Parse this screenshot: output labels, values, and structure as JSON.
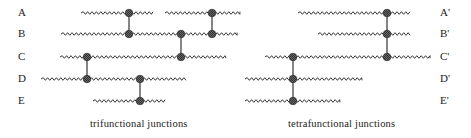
{
  "chart_data": {
    "type": "diagram",
    "panels": [
      {
        "caption": "trifunctional junctions",
        "row_labels": [
          "A",
          "B",
          "C",
          "D",
          "E"
        ],
        "rows_y": [
          13,
          34,
          57,
          79,
          101
        ],
        "label_x": 20,
        "chains": [
          {
            "row": 0,
            "x1": 81,
            "x2": 153
          },
          {
            "row": 0,
            "x1": 165,
            "x2": 240
          },
          {
            "row": 1,
            "x1": 61,
            "x2": 237
          },
          {
            "row": 2,
            "x1": 60,
            "x2": 226
          },
          {
            "row": 3,
            "x1": 41,
            "x2": 186
          },
          {
            "row": 4,
            "x1": 93,
            "x2": 165
          }
        ],
        "junctions": [
          {
            "x": 129,
            "from_row": 0,
            "to_row": 1
          },
          {
            "x": 212,
            "from_row": 0,
            "to_row": 1
          },
          {
            "x": 181,
            "from_row": 1,
            "to_row": 2
          },
          {
            "x": 87,
            "from_row": 2,
            "to_row": 3
          },
          {
            "x": 140,
            "from_row": 3,
            "to_row": 4
          }
        ],
        "caption_x": 90,
        "caption_y": 127
      },
      {
        "caption": "tetrafunctional junctions",
        "row_labels": [
          "A'",
          "B'",
          "C'",
          "D'",
          "E'"
        ],
        "rows_y": [
          13,
          34,
          57,
          79,
          101
        ],
        "label_x": 440,
        "chains": [
          {
            "row": 0,
            "x1": 298,
            "x2": 410
          },
          {
            "row": 1,
            "x1": 318,
            "x2": 410
          },
          {
            "row": 2,
            "x1": 265,
            "x2": 430
          },
          {
            "row": 3,
            "x1": 245,
            "x2": 362
          },
          {
            "row": 4,
            "x1": 245,
            "x2": 340
          }
        ],
        "junctions": [
          {
            "x": 387,
            "from_row": 0,
            "to_row": 2
          },
          {
            "x": 293,
            "from_row": 2,
            "to_row": 4
          }
        ],
        "caption_x": 288,
        "caption_y": 127
      }
    ]
  },
  "captions": {
    "left": "trifunctional junctions",
    "right": "tetrafunctional junctions"
  },
  "labels": {
    "left": [
      "A",
      "B",
      "C",
      "D",
      "E"
    ],
    "right": [
      "A'",
      "B'",
      "C'",
      "D'",
      "E'"
    ]
  }
}
